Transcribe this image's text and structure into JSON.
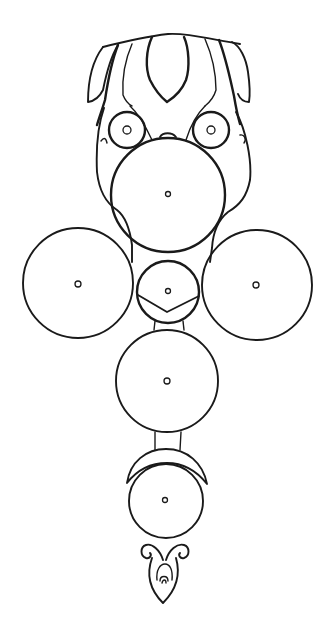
{
  "drawing": {
    "title": "Pendant ornament line sketch",
    "stroke_color": "#1a1a1a",
    "background_color": "#ffffff",
    "parts": [
      {
        "name": "crown-lobe-left"
      },
      {
        "name": "crown-lobe-right"
      },
      {
        "name": "crown-petal-center"
      },
      {
        "name": "eye-ring-left"
      },
      {
        "name": "eye-ring-right"
      },
      {
        "name": "disc-upper"
      },
      {
        "name": "disc-left"
      },
      {
        "name": "disc-right"
      },
      {
        "name": "disc-center-small"
      },
      {
        "name": "disc-lower"
      },
      {
        "name": "crescent"
      },
      {
        "name": "disc-bottom"
      },
      {
        "name": "drop-finial"
      }
    ]
  }
}
